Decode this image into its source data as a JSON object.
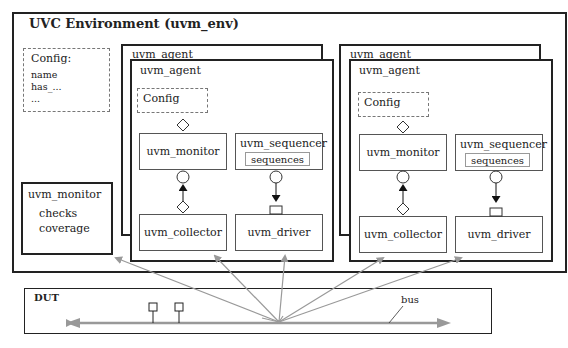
{
  "env": {
    "title": "UVC Environment  (uvm_env)",
    "config": {
      "title": "Config:",
      "items": [
        "name",
        "has_...",
        "..."
      ]
    },
    "monitor": {
      "title": "uvm_monitor",
      "items": [
        "checks",
        "coverage"
      ]
    }
  },
  "agents": [
    {
      "back_label": "uvm_agent",
      "front_label": "uvm_agent",
      "config_label": "Config",
      "monitor_label": "uvm_monitor",
      "sequencer_label": "uvm_sequencer",
      "sequences_label": "sequences",
      "collector_label": "uvm_collector",
      "driver_label": "uvm_driver"
    },
    {
      "back_label": "uvm_agent",
      "front_label": "uvm_agent",
      "config_label": "Config",
      "monitor_label": "uvm_monitor",
      "sequencer_label": "uvm_sequencer",
      "sequences_label": "sequences",
      "collector_label": "uvm_collector",
      "driver_label": "uvm_driver"
    }
  ],
  "dut": {
    "title": "DUT",
    "bus_label": "bus"
  },
  "colors": {
    "line": "#222222",
    "arrow": "#999999",
    "dash": "#777777"
  }
}
